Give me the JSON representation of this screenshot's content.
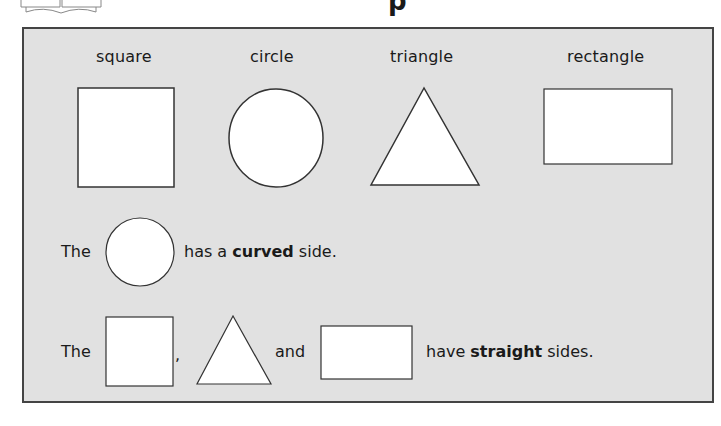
{
  "header": {
    "title_fragment": "p",
    "book_icon": "open-book-icon"
  },
  "labels": {
    "square": "square",
    "circle": "circle",
    "triangle": "triangle",
    "rectangle": "rectangle"
  },
  "sentence1": {
    "the": "The",
    "before_bold": "has a ",
    "bold": "curved",
    "after_bold": " side."
  },
  "sentence2": {
    "the": "The",
    "comma": ",",
    "and": "and",
    "before_bold": "have ",
    "bold": "straight",
    "after_bold": " sides."
  },
  "colors": {
    "panel_bg": "#e1e1e1",
    "panel_border": "#444444",
    "shape_fill": "#ffffff",
    "shape_stroke": "#333333"
  }
}
